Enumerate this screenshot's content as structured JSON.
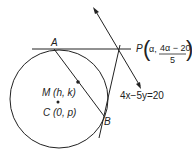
{
  "diagram": {
    "points": {
      "A": "A",
      "B": "B",
      "M": "M (h, k)",
      "C": "C (0, p)",
      "P_prefix": "P",
      "P_alpha": "α,",
      "P_num": "4α − 20",
      "P_den": "5"
    },
    "line_label": "4x−5y=20"
  }
}
